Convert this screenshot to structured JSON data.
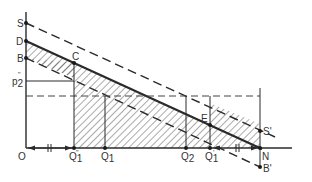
{
  "diagram": {
    "type": "economics-supply-demand-shift",
    "colors": {
      "line": "#2a2a2a",
      "hatch": "#555555",
      "background": "#ffffff"
    },
    "axes": {
      "origin_label": "O",
      "price_level_label": "p",
      "price_level_sub": "2",
      "price_level_sup": "\""
    },
    "vertical_axis_points": [
      {
        "label": "S"
      },
      {
        "label": "D"
      },
      {
        "label": "B"
      }
    ],
    "interior_points": [
      {
        "label": "C"
      },
      {
        "label": "E"
      }
    ],
    "right_points": [
      {
        "label": "S",
        "sup": "'"
      },
      {
        "label": "N"
      },
      {
        "label": "B",
        "sup": "'"
      }
    ],
    "quantity_labels": [
      {
        "label": "Q",
        "sub": "1",
        "sup": "\""
      },
      {
        "label": "Q",
        "sub": "1",
        "sup": ""
      },
      {
        "label": "Q",
        "sub": "2",
        "sup": ""
      },
      {
        "label": "Q",
        "sub": "1",
        "sup": "'"
      }
    ],
    "equal_marks": [
      "||",
      "||"
    ],
    "lines": [
      {
        "name": "SS'",
        "style": "dashed"
      },
      {
        "name": "DN",
        "style": "solid-thick"
      },
      {
        "name": "BB'",
        "style": "dashed"
      },
      {
        "name": "p2-level",
        "style": "solid"
      },
      {
        "name": "price-dashed-level",
        "style": "dashed"
      }
    ],
    "hatched_region": "between DN and BB' from Q1\" to N"
  }
}
